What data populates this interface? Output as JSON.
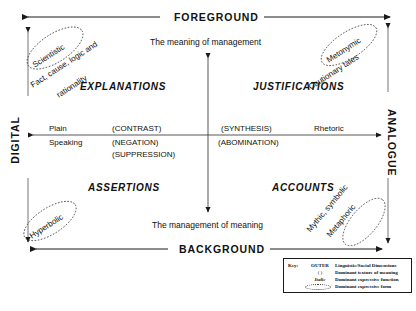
{
  "diagram": {
    "title_top_axis": "FOREGROUND",
    "title_bottom_axis": "BACKGROUND",
    "left_axis_label": "DIGITAL",
    "right_axis_label": "ANALOGUE",
    "centre_caption_top": "The meaning of management",
    "centre_caption_bottom": "The management of meaning",
    "quadrants": [
      {
        "name": "EXPLANATIONS"
      },
      {
        "name": "JUSTIFICATIONS"
      },
      {
        "name": "ASSERTIONS"
      },
      {
        "name": "ACCOUNTS"
      }
    ],
    "horizontal_axis": {
      "left_word_line1": "Plain",
      "left_word_line2": "Speaking",
      "right_word": "Rhetoric",
      "inner_left": [
        "(CONTRAST)",
        "(NEGATION)",
        "(SUPPRESSION)"
      ],
      "inner_right": [
        "(SYNTHESIS)",
        "(ABOMINATION)"
      ]
    },
    "corner_clusters": [
      {
        "position": "top-left",
        "ellipse_label": "Scientistic",
        "sub_label": "Fact, cause, logic and",
        "sub_label2": "rationality"
      },
      {
        "position": "top-right",
        "ellipse_label": "Metonymic",
        "sub_label": "Cautionary tales"
      },
      {
        "position": "bottom-left",
        "ellipse_label": "Hyperbolic",
        "sub_label": ""
      },
      {
        "position": "bottom-right",
        "ellipse_label": "Metaphoric",
        "sub_label": "Mythic, symbolic"
      }
    ],
    "legend": {
      "key_word": "Key:",
      "rows": [
        {
          "symbol": "OUTER",
          "style": "bold",
          "description": "Linguistic/Social Dimensions"
        },
        {
          "symbol": "(   )",
          "style": "plain",
          "description": "Dominant texture of meaning"
        },
        {
          "symbol": "Italic",
          "style": "italic",
          "description": "Dominant expressive function"
        },
        {
          "symbol": "ellipse",
          "style": "shape",
          "description": "Dominant expressive form"
        }
      ]
    },
    "colors": {
      "ink": "#111111",
      "background": "#ffffff",
      "rule": "#555555"
    }
  }
}
